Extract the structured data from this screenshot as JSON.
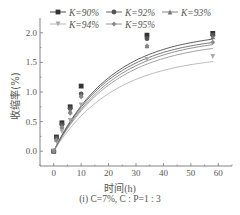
{
  "chart_data": {
    "type": "line",
    "title": "",
    "caption": "(i) C=7%, C : P=1 : 3",
    "xlabel": "时间(h)",
    "ylabel": "收缩率(%)",
    "xlim": [
      -5,
      65
    ],
    "ylim": [
      -0.25,
      2.25
    ],
    "xticks": [
      0,
      10,
      20,
      30,
      40,
      50,
      60
    ],
    "yticks": [
      "0.0",
      "0.5",
      "1.0",
      "1.5",
      "2.0"
    ],
    "grid": false,
    "legend_position": "top-inside",
    "x": [
      0,
      1,
      3,
      6,
      10,
      34,
      58
    ],
    "series": [
      {
        "name": "K=90%",
        "marker": "square",
        "color": "#333333",
        "values": [
          0.0,
          0.24,
          0.48,
          0.75,
          1.1,
          1.96,
          1.99
        ]
      },
      {
        "name": "K=92%",
        "marker": "circle",
        "color": "#555555",
        "values": [
          0.0,
          0.22,
          0.45,
          0.72,
          0.97,
          1.9,
          1.96
        ]
      },
      {
        "name": "K=93%",
        "marker": "triangle-up",
        "color": "#777777",
        "values": [
          0.0,
          0.2,
          0.42,
          0.68,
          0.95,
          1.78,
          1.93
        ]
      },
      {
        "name": "K=94%",
        "marker": "triangle-down",
        "color": "#aaaaaa",
        "values": [
          0.0,
          0.16,
          0.33,
          0.52,
          0.78,
          1.55,
          1.6
        ]
      },
      {
        "name": "K=95%",
        "marker": "diamond-star",
        "color": "#888888",
        "values": [
          0.0,
          0.19,
          0.4,
          0.64,
          0.92,
          1.78,
          1.84
        ]
      }
    ]
  }
}
